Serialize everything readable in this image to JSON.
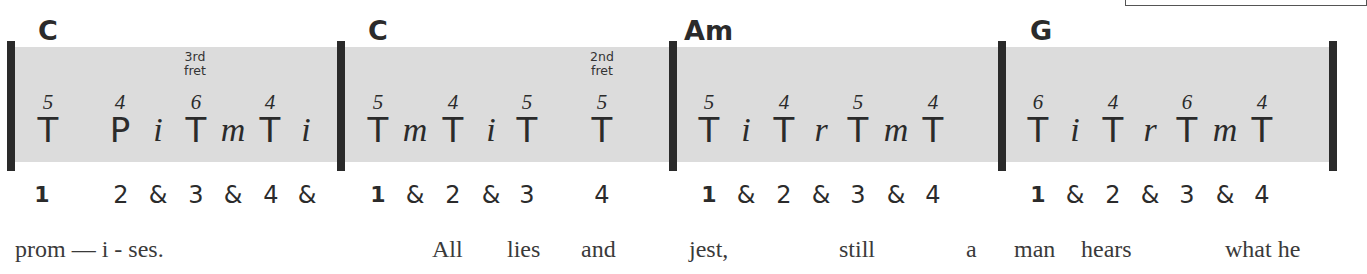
{
  "measures": [
    {
      "chord": "C",
      "fret_note": "3rd fret",
      "notes": [
        {
          "string": "5",
          "finger": "T"
        },
        {
          "string": "4",
          "finger": "P"
        },
        {
          "string": "",
          "finger": "i"
        },
        {
          "string": "6",
          "finger": "T"
        },
        {
          "string": "",
          "finger": "m"
        },
        {
          "string": "4",
          "finger": "T"
        },
        {
          "string": "",
          "finger": "i"
        }
      ],
      "beats": [
        "1",
        "2",
        "&",
        "3",
        "&",
        "4",
        "&"
      ]
    },
    {
      "chord": "C",
      "fret_note": "2nd fret",
      "notes": [
        {
          "string": "5",
          "finger": "T"
        },
        {
          "string": "",
          "finger": "m"
        },
        {
          "string": "4",
          "finger": "T"
        },
        {
          "string": "",
          "finger": "i"
        },
        {
          "string": "5",
          "finger": "T"
        },
        {
          "string": "5",
          "finger": "T"
        }
      ],
      "beats": [
        "1",
        "&",
        "2",
        "&",
        "3",
        "4"
      ]
    },
    {
      "chord": "Am",
      "notes": [
        {
          "string": "5",
          "finger": "T"
        },
        {
          "string": "",
          "finger": "i"
        },
        {
          "string": "4",
          "finger": "T"
        },
        {
          "string": "",
          "finger": "r"
        },
        {
          "string": "5",
          "finger": "T"
        },
        {
          "string": "",
          "finger": "m"
        },
        {
          "string": "4",
          "finger": "T"
        }
      ],
      "beats": [
        "1",
        "&",
        "2",
        "&",
        "3",
        "&",
        "4"
      ]
    },
    {
      "chord": "G",
      "notes": [
        {
          "string": "6",
          "finger": "T"
        },
        {
          "string": "",
          "finger": "i"
        },
        {
          "string": "4",
          "finger": "T"
        },
        {
          "string": "",
          "finger": "r"
        },
        {
          "string": "6",
          "finger": "T"
        },
        {
          "string": "",
          "finger": "m"
        },
        {
          "string": "4",
          "finger": "T"
        }
      ],
      "beats": [
        "1",
        "&",
        "2",
        "&",
        "3",
        "&",
        "4"
      ]
    }
  ],
  "lyrics": [
    "prom — i - ses.",
    "All",
    "lies",
    "and",
    "jest,",
    "still",
    "a",
    "man",
    "hears",
    "what he"
  ]
}
